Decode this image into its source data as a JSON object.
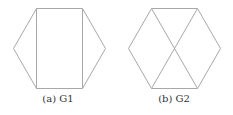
{
  "figures": [
    {
      "id": "G1",
      "caption": "(a) G1",
      "description": "Hexagon with two vertical chords",
      "vertices": [
        [
          36,
          8
        ],
        [
          82,
          8
        ],
        [
          105,
          48
        ],
        [
          82,
          88
        ],
        [
          36,
          88
        ],
        [
          13,
          48
        ]
      ],
      "edges": [
        [
          0,
          1
        ],
        [
          1,
          2
        ],
        [
          2,
          3
        ],
        [
          3,
          4
        ],
        [
          4,
          5
        ],
        [
          5,
          0
        ],
        [
          0,
          4
        ],
        [
          1,
          3
        ]
      ]
    },
    {
      "id": "G2",
      "caption": "(b) G2",
      "description": "Hexagon with two crossing diagonals",
      "vertices": [
        [
          35,
          8
        ],
        [
          81,
          8
        ],
        [
          104,
          48
        ],
        [
          81,
          88
        ],
        [
          35,
          88
        ],
        [
          12,
          48
        ]
      ],
      "edges": [
        [
          0,
          1
        ],
        [
          1,
          2
        ],
        [
          2,
          3
        ],
        [
          3,
          4
        ],
        [
          4,
          5
        ],
        [
          5,
          0
        ],
        [
          0,
          3
        ],
        [
          1,
          4
        ]
      ]
    }
  ],
  "colors": {
    "edge": "#a8a8a8",
    "caption": "#333333"
  }
}
